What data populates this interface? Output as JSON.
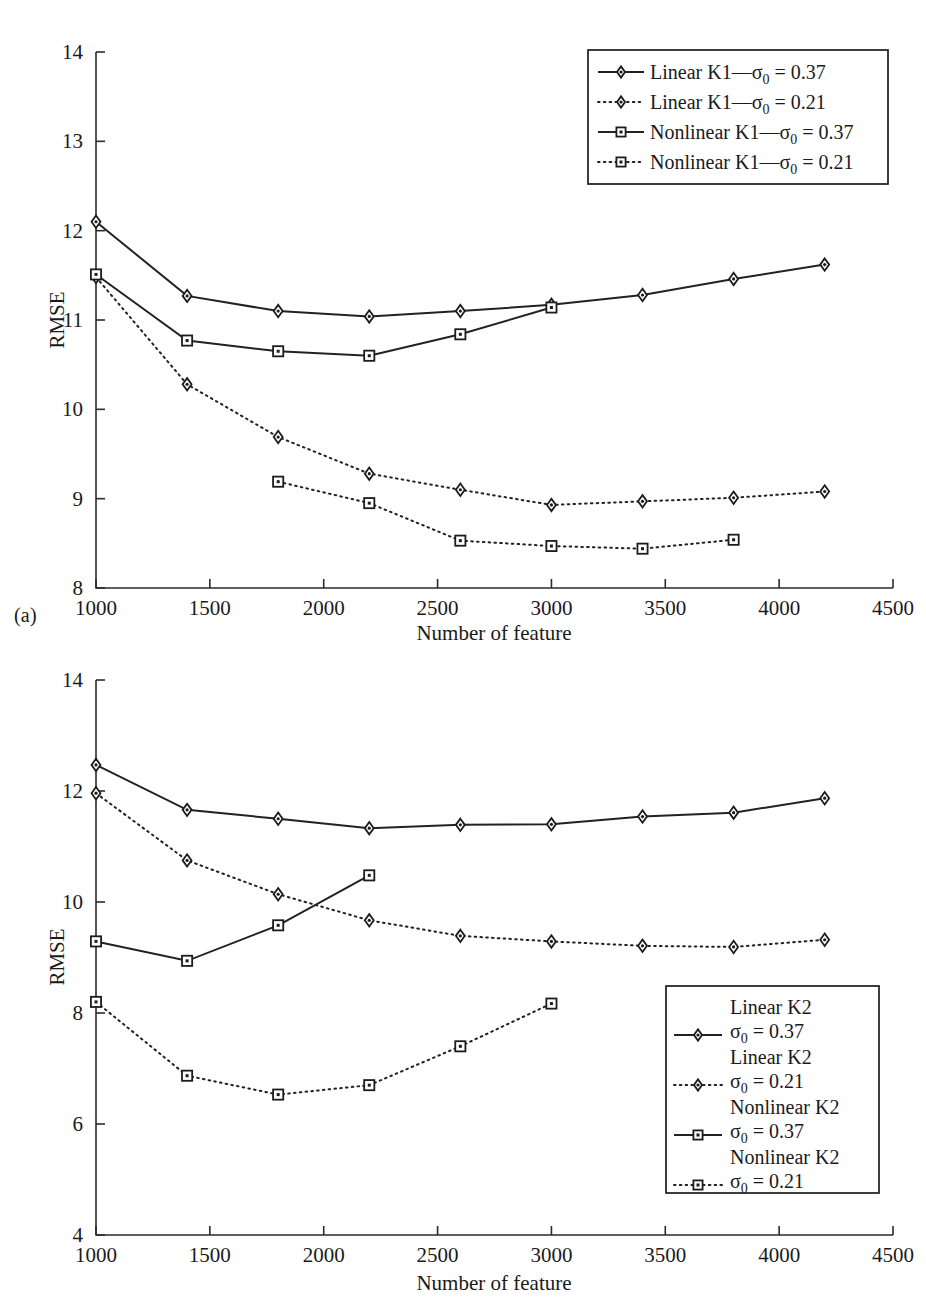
{
  "figure": {
    "panels": [
      {
        "tag": "(a)",
        "xlabel": "Number of feature",
        "ylabel": "RMSE"
      },
      {
        "tag": "(b)",
        "xlabel": "Number of feature",
        "ylabel": "RMSE"
      }
    ]
  },
  "chart_data": [
    {
      "type": "line",
      "panel": "(a)",
      "title": "",
      "xlabel": "Number of feature",
      "ylabel": "RMSE",
      "xlim": [
        1000,
        4500
      ],
      "ylim": [
        8,
        14
      ],
      "xticks": [
        1000,
        1500,
        2000,
        2500,
        3000,
        3500,
        4000,
        4500
      ],
      "xtick_labels": [
        "1000",
        "1500",
        "2000",
        "2500",
        "3000",
        "3500",
        "4000",
        "4500"
      ],
      "yticks": [
        8,
        9,
        10,
        11,
        12,
        13,
        14
      ],
      "ytick_labels": [
        "8",
        "9",
        "10",
        "11",
        "12",
        "13",
        "14"
      ],
      "grid": false,
      "legend_position": "top-right",
      "series": [
        {
          "name": "Linear K1—σ0 = 0.37",
          "label_main": "Linear K1—",
          "label_sigma": "σ",
          "label_sub": "0",
          "label_value": " = 0.37",
          "style": "solid",
          "marker": "diamond",
          "x": [
            1000,
            1400,
            1800,
            2200,
            2600,
            3000,
            3400,
            3800,
            4200
          ],
          "y": [
            12.1,
            11.27,
            11.1,
            11.04,
            11.1,
            11.17,
            11.28,
            11.46,
            11.62
          ]
        },
        {
          "name": "Linear K1—σ0 = 0.21",
          "label_main": "Linear K1—",
          "label_sigma": "σ",
          "label_sub": "0",
          "label_value": " = 0.21",
          "style": "dotted",
          "marker": "diamond",
          "x": [
            1000,
            1400,
            1800,
            2200,
            2600,
            3000,
            3400,
            3800,
            4200
          ],
          "y": [
            11.48,
            10.28,
            9.69,
            9.28,
            9.1,
            8.93,
            8.97,
            9.01,
            9.08
          ]
        },
        {
          "name": "Nonlinear K1—σ0 = 0.37",
          "label_main": "Nonlinear K1—",
          "label_sigma": "σ",
          "label_sub": "0",
          "label_value": " = 0.37",
          "style": "solid",
          "marker": "square",
          "x": [
            1000,
            1400,
            1800,
            2200,
            2600,
            3000
          ],
          "y": [
            11.51,
            10.77,
            10.65,
            10.6,
            10.84,
            11.14
          ]
        },
        {
          "name": "Nonlinear K1—σ0 = 0.21",
          "label_main": "Nonlinear K1—",
          "label_sigma": "σ",
          "label_sub": "0",
          "label_value": " = 0.21",
          "style": "dotted",
          "marker": "square",
          "x": [
            1800,
            2200,
            2600,
            3000,
            3400,
            3800
          ],
          "y": [
            9.19,
            8.95,
            8.53,
            8.47,
            8.44,
            8.54
          ]
        }
      ]
    },
    {
      "type": "line",
      "panel": "(b)",
      "title": "",
      "xlabel": "Number of feature",
      "ylabel": "RMSE",
      "xlim": [
        1000,
        4500
      ],
      "ylim": [
        4,
        14
      ],
      "xticks": [
        1000,
        1500,
        2000,
        2500,
        3000,
        3500,
        4000,
        4500
      ],
      "xtick_labels": [
        "1000",
        "1500",
        "2000",
        "2500",
        "3000",
        "3500",
        "4000",
        "4500"
      ],
      "yticks": [
        4,
        6,
        8,
        10,
        12,
        14
      ],
      "ytick_labels": [
        "4",
        "6",
        "8",
        "10",
        "12",
        "14"
      ],
      "grid": false,
      "legend_position": "bottom-right",
      "series": [
        {
          "name": "Linear K2 σ0 = 0.37",
          "label_main": "Linear K2",
          "label_sigma": "σ",
          "label_sub": "0",
          "label_value": " = 0.37",
          "style": "solid",
          "marker": "diamond",
          "x": [
            1000,
            1400,
            1800,
            2200,
            2600,
            3000,
            3400,
            3800,
            4200
          ],
          "y": [
            12.47,
            11.66,
            11.5,
            11.33,
            11.39,
            11.4,
            11.54,
            11.61,
            11.87
          ]
        },
        {
          "name": "Linear K2 σ0 = 0.21",
          "label_main": "Linear K2",
          "label_sigma": "σ",
          "label_sub": "0",
          "label_value": " = 0.21",
          "style": "dotted",
          "marker": "diamond",
          "x": [
            1000,
            1400,
            1800,
            2200,
            2600,
            3000,
            3400,
            3800,
            4200
          ],
          "y": [
            11.96,
            10.75,
            10.14,
            9.67,
            9.39,
            9.29,
            9.21,
            9.19,
            9.32
          ]
        },
        {
          "name": "Nonlinear K2 σ0 = 0.37",
          "label_main": "Nonlinear K2",
          "label_sigma": "σ",
          "label_sub": "0",
          "label_value": " = 0.37",
          "style": "solid",
          "marker": "square",
          "x": [
            1000,
            1400,
            1800,
            2200
          ],
          "y": [
            9.29,
            8.94,
            9.58,
            10.48
          ]
        },
        {
          "name": "Nonlinear K2 σ0 = 0.21",
          "label_main": "Nonlinear K2",
          "label_sigma": "σ",
          "label_sub": "0",
          "label_value": " = 0.21",
          "style": "dotted",
          "marker": "square",
          "x": [
            1000,
            1400,
            1800,
            2200,
            2600,
            3000
          ],
          "y": [
            8.2,
            6.87,
            6.53,
            6.7,
            7.4,
            8.17
          ]
        }
      ]
    }
  ]
}
